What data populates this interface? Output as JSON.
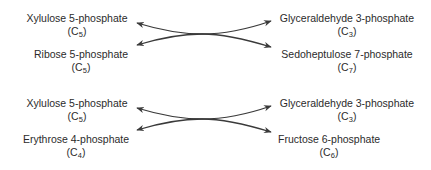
{
  "reactions": [
    {
      "left": [
        {
          "name": "Xylulose 5-phosphate",
          "formula_prefix": "(C",
          "carbons": "5",
          "formula_suffix": ")"
        },
        {
          "name": "Ribose 5-phosphate",
          "formula_prefix": "(C",
          "carbons": "5",
          "formula_suffix": ")"
        }
      ],
      "right": [
        {
          "name": "Glyceraldehyde 3-phosphate",
          "formula_prefix": "(C",
          "carbons": "3",
          "formula_suffix": ")"
        },
        {
          "name": "Sedoheptulose 7-phosphate",
          "formula_prefix": "(C",
          "carbons": "7",
          "formula_suffix": ")"
        }
      ]
    },
    {
      "left": [
        {
          "name": "Xylulose 5-phosphate",
          "formula_prefix": "(C",
          "carbons": "5",
          "formula_suffix": ")"
        },
        {
          "name": "Erythrose 4-phosphate",
          "formula_prefix": "(C",
          "carbons": "4",
          "formula_suffix": ")"
        }
      ],
      "right": [
        {
          "name": "Glyceraldehyde 3-phosphate",
          "formula_prefix": "(C",
          "carbons": "3",
          "formula_suffix": ")"
        },
        {
          "name": "Fructose 6-phosphate",
          "formula_prefix": "(C",
          "carbons": "6",
          "formula_suffix": ")"
        }
      ]
    }
  ],
  "colors": {
    "text": "#2b2b2b",
    "arrow": "#3a3a3a",
    "background": "#ffffff"
  }
}
